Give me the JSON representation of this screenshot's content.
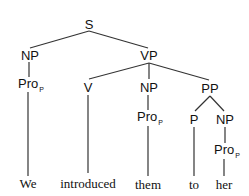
{
  "tree": {
    "nodes": {
      "S": {
        "label": "S"
      },
      "NP1": {
        "label": "NP"
      },
      "Pro1": {
        "label": "Pro",
        "sub": "P"
      },
      "VP": {
        "label": "VP"
      },
      "V": {
        "label": "V"
      },
      "NP2": {
        "label": "NP"
      },
      "Pro2": {
        "label": "Pro",
        "sub": "P"
      },
      "PP": {
        "label": "PP"
      },
      "P": {
        "label": "P"
      },
      "NP3": {
        "label": "NP"
      },
      "Pro3": {
        "label": "Pro",
        "sub": "P"
      }
    },
    "words": [
      "We",
      "introduced",
      "them",
      "to",
      "her"
    ],
    "edges": [
      [
        "S",
        "NP1"
      ],
      [
        "S",
        "VP"
      ],
      [
        "NP1",
        "Pro1"
      ],
      [
        "Pro1",
        "We"
      ],
      [
        "VP",
        "V"
      ],
      [
        "VP",
        "NP2"
      ],
      [
        "VP",
        "PP"
      ],
      [
        "V",
        "introduced"
      ],
      [
        "NP2",
        "Pro2"
      ],
      [
        "Pro2",
        "them"
      ],
      [
        "PP",
        "P"
      ],
      [
        "PP",
        "NP3"
      ],
      [
        "P",
        "to"
      ],
      [
        "NP3",
        "Pro3"
      ],
      [
        "Pro3",
        "her"
      ]
    ]
  }
}
